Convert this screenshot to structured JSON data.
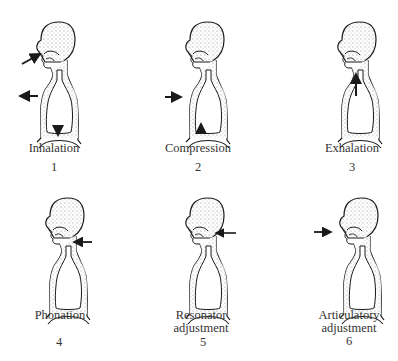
{
  "figures": [
    {
      "label": "Inhalation",
      "number": "1",
      "arrows": [
        "mouth-inward",
        "chest-outward",
        "diaphragm-down"
      ]
    },
    {
      "label": "Compression",
      "number": "2",
      "arrows": [
        "chest-inward",
        "diaphragm-up"
      ]
    },
    {
      "label": "Exhalation",
      "number": "3",
      "arrows": [
        "trachea-up"
      ]
    },
    {
      "label": "Phonation",
      "number": "4",
      "arrows": [
        "larynx-inward"
      ]
    },
    {
      "label_lines": [
        "Resonator",
        "adjustment"
      ],
      "number": "5",
      "arrows": [
        "pharynx-inward"
      ]
    },
    {
      "label_lines": [
        "Articulatory",
        "adjustment"
      ],
      "number": "6",
      "arrows": [
        "mouth-inward"
      ]
    }
  ],
  "colors": {
    "ink": "#1a1a1a",
    "stipple": "#9a9a9a",
    "background": "#ffffff"
  }
}
